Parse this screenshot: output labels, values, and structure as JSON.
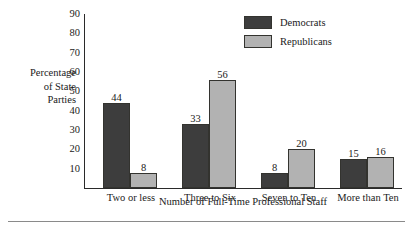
{
  "chart_data": {
    "type": "bar",
    "title": "",
    "xlabel": "Number of Full-Time Professional Staff",
    "ylabel_lines": [
      "Percentage",
      "of State",
      "Parties"
    ],
    "ylabel": "Percentage of State Parties",
    "categories": [
      "Two or less",
      "Three to Six",
      "Seven to Ten",
      "More than Ten"
    ],
    "series": [
      {
        "name": "Democrats",
        "color": "#3d3d3d",
        "values": [
          44,
          33,
          8,
          15
        ]
      },
      {
        "name": "Republicans",
        "color": "#b2b2b2",
        "values": [
          8,
          56,
          20,
          16
        ]
      }
    ],
    "ylim": [
      0,
      90
    ],
    "yticks": [
      90,
      80,
      70,
      60,
      50,
      40,
      30,
      20,
      10
    ],
    "grid": false,
    "legend_position": "top-right",
    "data_labels": true,
    "axis_color": "#2a2a2a",
    "bar_border_color": "#33332f"
  },
  "legend": {
    "items": [
      {
        "label": "Democrats"
      },
      {
        "label": "Republicans"
      }
    ]
  }
}
